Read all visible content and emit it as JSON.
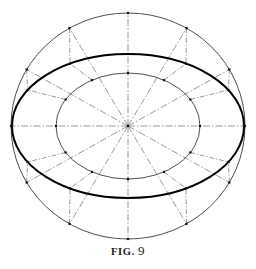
{
  "figure": {
    "caption_label": "FIG.",
    "caption_number": "9",
    "caption_full": "FIG. 9",
    "background_color": "#ffffff",
    "ink_color": "#000000",
    "construction_line_color": "#6e6e6e",
    "thin_curve_color": "#3a3a3a",
    "bold_curve_color": "#000000"
  },
  "geometry": {
    "center": {
      "x": 128,
      "y": 126
    },
    "outer_circle": {
      "name": "major-axis-circle",
      "rx": 117,
      "ry": 113,
      "stroke_width": 0.9,
      "color": "#3a3a3a"
    },
    "inner_circle": {
      "name": "minor-axis-circle",
      "rx": 72,
      "ry": 53,
      "stroke_width": 0.9,
      "color": "#3a3a3a"
    },
    "ellipse": {
      "name": "constructed-ellipse",
      "rx": 116,
      "ry": 72,
      "stroke_width": 2.0,
      "color": "#000000"
    },
    "radial_angles_deg": [
      0,
      30,
      60,
      90,
      120,
      150,
      180,
      210,
      240,
      270,
      300,
      330
    ],
    "radial_count": 12,
    "radial_style": "dash-dot",
    "radial_dasharray": "7 2 1.5 2",
    "radial_stroke_width": 0.7,
    "projection_style": "dash-dot",
    "projection_dasharray": "5 1.8 1.2 1.8",
    "projection_stroke_width": 0.7,
    "marker_size": 2.2,
    "marker_color": "#111111"
  },
  "chart_data": {
    "type": "diagram",
    "elements": [
      {
        "name": "outer-circle",
        "role": "major axis circle",
        "radius_x": 117,
        "radius_y": 113
      },
      {
        "name": "inner-circle",
        "role": "minor axis circle",
        "radius_x": 72,
        "radius_y": 53
      },
      {
        "name": "ellipse",
        "role": "resulting ellipse",
        "radius_x": 116,
        "radius_y": 72
      },
      {
        "name": "radial-lines",
        "role": "12 radii at 30 degree intervals",
        "count": 12
      },
      {
        "name": "vertical-projections",
        "role": "drop lines from outer circle",
        "count": 8
      },
      {
        "name": "horizontal-projections",
        "role": "lines from inner circle",
        "count": 8
      },
      {
        "name": "intersection-points",
        "role": "ellipse construction points",
        "count": 12
      }
    ]
  }
}
